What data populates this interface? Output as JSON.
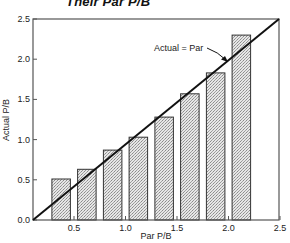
{
  "chart_data": {
    "type": "bar",
    "title": "Their Par P/B",
    "xlabel": "Par P/B",
    "ylabel": "Actual P/B",
    "xlim": [
      0.12,
      2.5
    ],
    "ylim": [
      0.0,
      2.5
    ],
    "grid": false,
    "legend": null,
    "x_ticks": [
      0.5,
      1.0,
      1.5,
      2.0,
      2.5
    ],
    "x_tick_labels": [
      "0.5",
      "1.0",
      "1.5",
      "2.0",
      "2.5"
    ],
    "y_ticks": [
      0.0,
      0.5,
      1.0,
      1.5,
      2.0,
      2.5
    ],
    "y_tick_labels": [
      "0.0",
      "0.5",
      "1.0",
      "1.5",
      "2.0",
      "2.5"
    ],
    "bar_width": 0.18,
    "categories": [
      0.375,
      0.625,
      0.875,
      1.125,
      1.375,
      1.625,
      1.875,
      2.125
    ],
    "values": [
      0.51,
      0.63,
      0.87,
      1.03,
      1.28,
      1.57,
      1.83,
      2.3
    ],
    "reference_line": {
      "label": "Actual = Par",
      "from": [
        0.12,
        0.0
      ],
      "to": [
        2.5,
        2.5
      ]
    },
    "annotation": {
      "text": "Actual = Par",
      "text_pos": [
        1.25,
        2.15
      ],
      "arrow_to": [
        2.0,
        1.98
      ]
    }
  },
  "colors": {
    "bar_fill": "#d9d9d9",
    "bar_stroke": "#333333",
    "axis": "#444444",
    "line": "#111111"
  }
}
